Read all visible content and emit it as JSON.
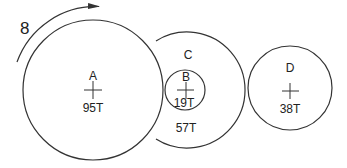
{
  "diagram": {
    "type": "gear-train",
    "rotation_label": "8",
    "rotation_direction": "counterclockwise",
    "stroke_color": "#333333",
    "background": "#ffffff",
    "gears": [
      {
        "id": "A",
        "label": "A",
        "teeth": "95T",
        "cx": 93,
        "cy": 90,
        "r": 70
      },
      {
        "id": "C",
        "label": "C",
        "teeth": "57T",
        "cx": 187,
        "cy": 90,
        "r": 58
      },
      {
        "id": "B",
        "label": "B",
        "teeth": "19T",
        "cx": 185,
        "cy": 90,
        "r": 20
      },
      {
        "id": "D",
        "label": "D",
        "teeth": "38T",
        "cx": 290,
        "cy": 88,
        "r": 42
      }
    ]
  }
}
